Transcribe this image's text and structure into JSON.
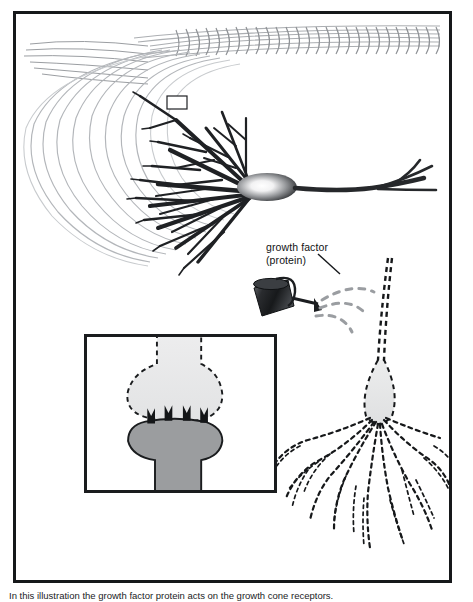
{
  "figure": {
    "caption": "In this illustration the growth factor protein acts on the growth cone receptors."
  },
  "labels": {
    "growth_factor": "growth factor\n(protein)"
  },
  "colors": {
    "frame": "#16181a",
    "dendrite_dark": "#1f2124",
    "fiber_gray": "#a9acb0",
    "soma_edge": "#2b2d30",
    "soma_core": "#ffffff",
    "can_body": "#202225",
    "droplet_gray": "#9a9da1",
    "cone_light": "#e6e7e8",
    "cone_dark": "#9b9d9f",
    "receptor": "#141618",
    "background": "#ffffff"
  },
  "elements": {
    "axon_bundle": "horizontal gray fiber bundle across top",
    "dendrite_arbor": "dark branching dendrites radiating left from soma",
    "soma": "cell body with radial white-to-dark gradient",
    "axon": "long axon extending right then curving down",
    "roi_box": "small rectangle marking region of interest in dendrite field",
    "watering_can": "dark watering can pouring growth factor",
    "droplets": "dashed gray droplet arcs",
    "dashed_axon": "dashed descending axon to growth cone",
    "growth_cone_root": "dashed root-like growth cone arbor",
    "inset_cone_light": "light dashed growth cone before contact",
    "inset_cone_dark": "gray growth cone with receptors",
    "receptors": "four black crown-shaped receptors"
  }
}
